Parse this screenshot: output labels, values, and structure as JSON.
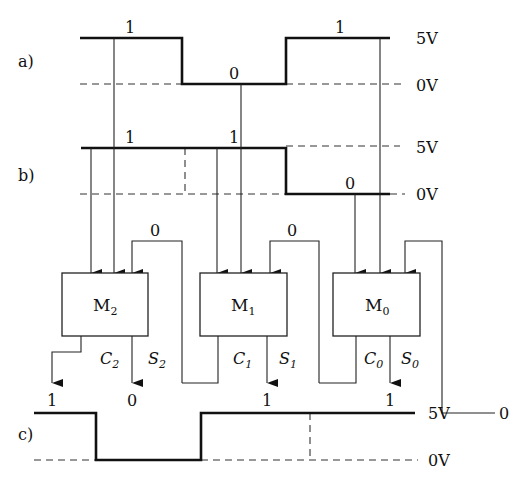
{
  "figure": {
    "panels": {
      "a": {
        "label": "a)",
        "bits": [
          "1",
          "0",
          "1"
        ],
        "high_label": "5V",
        "low_label": "0V"
      },
      "b": {
        "label": "b)",
        "bits": [
          "1",
          "1",
          "0"
        ],
        "high_label": "5V",
        "low_label": "0V"
      },
      "c": {
        "label": "c)",
        "bits": [
          "1",
          "0",
          "1",
          "1"
        ],
        "high_label": "5V",
        "low_label": "0V"
      }
    },
    "blocks": [
      {
        "name": "M",
        "sub": "2",
        "carry": "C",
        "carry_sub": "2",
        "sum": "S",
        "sum_sub": "2",
        "carry_in": "0"
      },
      {
        "name": "M",
        "sub": "1",
        "carry": "C",
        "carry_sub": "1",
        "sum": "S",
        "sum_sub": "1",
        "carry_in": "0"
      },
      {
        "name": "M",
        "sub": "0",
        "carry": "C",
        "carry_sub": "0",
        "sum": "S",
        "sum_sub": "0",
        "carry_in": "0"
      }
    ],
    "outputs": [
      "1",
      "0",
      "1",
      "1"
    ]
  }
}
